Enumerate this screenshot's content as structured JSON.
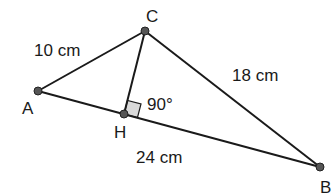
{
  "diagram": {
    "type": "geometry-triangle",
    "points": {
      "A": {
        "label": "A",
        "x": 38,
        "y": 91
      },
      "B": {
        "label": "B",
        "x": 320,
        "y": 167
      },
      "C": {
        "label": "C",
        "x": 145,
        "y": 31
      },
      "H": {
        "label": "H",
        "x": 124,
        "y": 114
      }
    },
    "segments": [
      {
        "from": "A",
        "to": "C",
        "length_label": "10 cm"
      },
      {
        "from": "C",
        "to": "B",
        "length_label": "18 cm"
      },
      {
        "from": "A",
        "to": "B",
        "length_label": "24 cm"
      },
      {
        "from": "C",
        "to": "H",
        "length_label": ""
      }
    ],
    "right_angle": {
      "at": "H",
      "label": "90°"
    },
    "colors": {
      "line": "#1a1a1a",
      "point_fill": "#555555",
      "right_angle_fill": "#d9d9d9"
    }
  }
}
